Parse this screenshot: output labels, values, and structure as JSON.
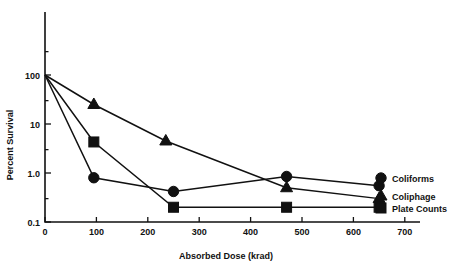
{
  "chart_data": {
    "type": "line",
    "title": "",
    "xlabel": "Absorbed Dose (krad)",
    "ylabel": "Percent Survival",
    "yscale": "log",
    "xlim": [
      0,
      730
    ],
    "ylim": [
      0.1,
      300
    ],
    "grid": false,
    "legend_position": "right-outside",
    "x_ticks": [
      0,
      100,
      200,
      300,
      400,
      500,
      600,
      700
    ],
    "x_tick_labels": [
      "0",
      "100",
      "200",
      "300",
      "400",
      "500",
      "600",
      "700"
    ],
    "y_ticks": [
      100,
      10,
      1.0,
      0.1
    ],
    "y_tick_labels": [
      "100",
      "10",
      "1.0",
      "0.1"
    ],
    "series": [
      {
        "name": "Coliforms",
        "marker": "circle",
        "x": [
          0,
          95,
          250,
          470,
          650
        ],
        "values": [
          100,
          0.8,
          0.42,
          0.85,
          0.55
        ]
      },
      {
        "name": "Coliphage",
        "marker": "triangle",
        "x": [
          0,
          95,
          235,
          470,
          650
        ],
        "values": [
          100,
          25,
          4.5,
          0.5,
          0.3
        ]
      },
      {
        "name": "Plate Counts",
        "marker": "square",
        "x": [
          0,
          95,
          250,
          470,
          650
        ],
        "values": [
          100,
          4.3,
          0.2,
          0.2,
          0.2
        ]
      }
    ]
  },
  "legend": {
    "items": [
      {
        "label": "Coliforms",
        "marker": "circle"
      },
      {
        "label": "Coliphage",
        "marker": "triangle"
      },
      {
        "label": "Plate Counts",
        "marker": "square"
      }
    ]
  },
  "axes": {
    "x_title": "Absorbed Dose (krad)",
    "y_title": "Percent Survival"
  },
  "colors": {
    "ink": "#111111",
    "background": "#ffffff"
  }
}
